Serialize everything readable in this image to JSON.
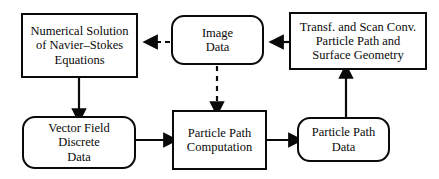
{
  "diagram": {
    "type": "flow-diagram",
    "canvas": {
      "width": 439,
      "height": 179
    },
    "style": {
      "background": "#ffffff",
      "stroke": "#0a0a0a",
      "text": "#0a0a0a"
    },
    "nodes": [
      {
        "id": "navier-stokes",
        "shape": "rectangle",
        "role": "process",
        "lines": [
          "Numerical Solution",
          "of Navier–Stokes",
          "Equations"
        ]
      },
      {
        "id": "image-data",
        "shape": "rounded-rectangle",
        "role": "data",
        "lines": [
          "Image",
          "Data"
        ]
      },
      {
        "id": "transf-scan",
        "shape": "rectangle",
        "role": "process",
        "lines": [
          "Transf. and Scan Conv.",
          "Particle Path and",
          "Surface Geometry"
        ]
      },
      {
        "id": "vector-field",
        "shape": "rounded-rectangle",
        "role": "data",
        "lines": [
          "Vector Field",
          "Discrete",
          "Data"
        ]
      },
      {
        "id": "particle-computation",
        "shape": "rectangle",
        "role": "process",
        "lines": [
          "Particle Path",
          "Computation"
        ]
      },
      {
        "id": "particle-data",
        "shape": "rounded-rectangle",
        "role": "data",
        "lines": [
          "Particle Path",
          "Data"
        ]
      }
    ],
    "edges": [
      {
        "id": "image-data-to-navier-stokes",
        "from": "image-data",
        "to": "navier-stokes",
        "style": "dashed",
        "direction": "left"
      },
      {
        "id": "transf-scan-to-image-data",
        "from": "transf-scan",
        "to": "image-data",
        "style": "solid",
        "direction": "left"
      },
      {
        "id": "navier-stokes-to-vector-field",
        "from": "navier-stokes",
        "to": "vector-field",
        "style": "solid",
        "direction": "down"
      },
      {
        "id": "image-data-to-particle-computation",
        "from": "image-data",
        "to": "particle-computation",
        "style": "dashed",
        "direction": "down"
      },
      {
        "id": "vector-field-to-particle-computation",
        "from": "vector-field",
        "to": "particle-computation",
        "style": "solid",
        "direction": "right"
      },
      {
        "id": "particle-computation-to-particle-data",
        "from": "particle-computation",
        "to": "particle-data",
        "style": "solid",
        "direction": "right"
      },
      {
        "id": "particle-data-to-transf-scan",
        "from": "particle-data",
        "to": "transf-scan",
        "style": "solid",
        "direction": "up"
      }
    ]
  }
}
